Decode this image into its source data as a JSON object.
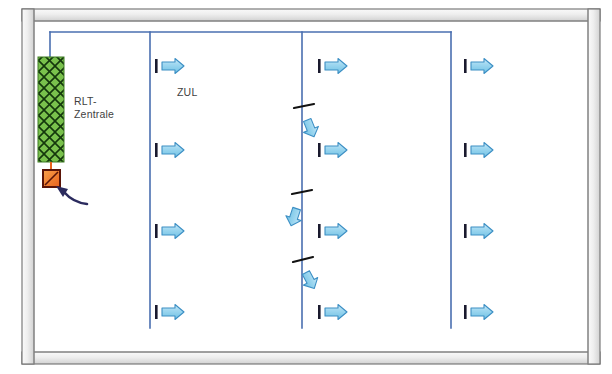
{
  "diagram": {
    "labels": [
      {
        "id": "rlt",
        "text": "RLT-\nZentrale"
      },
      {
        "id": "zul",
        "text": "ZUL"
      }
    ],
    "colors": {
      "wall_fill": "#e8e8e8",
      "wall_stroke": "#6f6f6f",
      "duct_line": "#4a6fb0",
      "arrow_fill": "#a8dcf2",
      "arrow_stroke": "#3c8fc4",
      "grille_tick": "#1a1a2e",
      "unit_fill": "#79c14c",
      "unit_hatch": "#1e4a12",
      "damper_tick": "#111111",
      "valve_fill": "#f07a28",
      "valve_stroke": "#5a1408",
      "pointer_arrow": "#2b2b5e"
    },
    "elements": {
      "wall_label": "Gebaeudehuelle",
      "air_handling_unit": "RLT-Zentrale",
      "supply_air_label": "ZUL",
      "supply_grille_count": 12,
      "damper_count": 3,
      "riser_count": 4
    }
  }
}
